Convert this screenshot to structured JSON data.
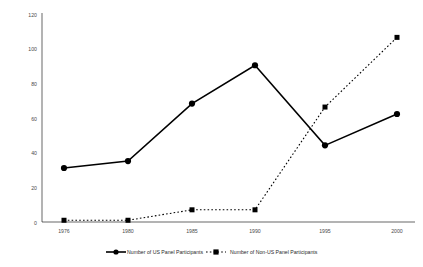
{
  "chart_data": {
    "type": "line",
    "title": "",
    "subtitle": "",
    "xlabel": "",
    "ylabel": "",
    "x": [
      1976,
      1980,
      1985,
      1990,
      1995,
      2000
    ],
    "categories": [
      "1976",
      "1980",
      "1985",
      "1990",
      "1995",
      "2000"
    ],
    "xlim": [
      1974,
      2002
    ],
    "ylim": [
      0,
      120
    ],
    "yticks": [
      0,
      20,
      40,
      60,
      80,
      100,
      120
    ],
    "ytick_labels": [
      "0",
      "20",
      "40",
      "60",
      "80",
      "100",
      "120"
    ],
    "xtick_labels": [
      "1976",
      "1980",
      "1985",
      "1990",
      "1995",
      "2000"
    ],
    "grid": false,
    "legend_position": "bottom",
    "series": [
      {
        "name": "Number of US Panel Participants",
        "marker": "circle",
        "linestyle": "solid",
        "color": "#000000",
        "values": [
          31,
          35,
          68,
          90,
          44,
          62
        ]
      },
      {
        "name": "Number of Non-US Panel Participants",
        "marker": "square",
        "linestyle": "dashed",
        "color": "#000000",
        "values": [
          1,
          1,
          7,
          7,
          66,
          106
        ]
      }
    ]
  },
  "axes": {
    "y_tick_0": "0",
    "y_tick_1": "20",
    "y_tick_2": "40",
    "y_tick_3": "60",
    "y_tick_4": "80",
    "y_tick_5": "100",
    "y_tick_6": "120",
    "x_tick_0": "1976",
    "x_tick_1": "1980",
    "x_tick_2": "1985",
    "x_tick_3": "1990",
    "x_tick_4": "1995",
    "x_tick_5": "2000"
  },
  "legend": {
    "item_0_label": "Number of US Panel Participants",
    "item_1_label": "Number of Non-US Panel Participants"
  },
  "colors": {
    "line": "#000000",
    "tick_text": "#4a4a4a",
    "legend_text": "#2b2b2b",
    "background": "#ffffff"
  }
}
